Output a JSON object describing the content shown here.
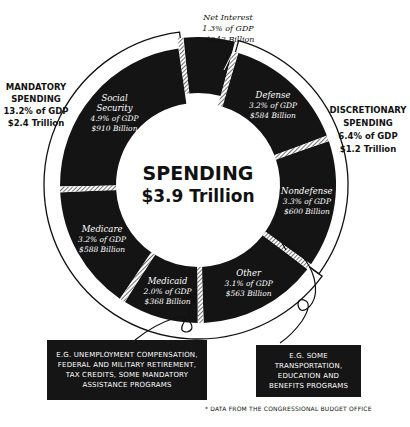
{
  "chart_data": {
    "type": "pie",
    "subtype": "donut",
    "title": "SPENDING",
    "total_label": "$3.9 Trillion",
    "unit": "Billion USD",
    "segments": [
      {
        "name": "Net Interest",
        "pct_gdp": "1.3% of GDP",
        "amount": "$242 Billion",
        "value": 242,
        "group": "net_interest"
      },
      {
        "name": "Defense",
        "pct_gdp": "3.2% of GDP",
        "amount": "$584 Billion",
        "value": 584,
        "group": "discretionary"
      },
      {
        "name": "Nondefense",
        "pct_gdp": "3.3% of GDP",
        "amount": "$600 Billion",
        "value": 600,
        "group": "discretionary"
      },
      {
        "name": "Other",
        "pct_gdp": "3.1% of GDP",
        "amount": "$563 Billion",
        "value": 563,
        "group": "mandatory"
      },
      {
        "name": "Medicaid",
        "pct_gdp": "2.0% of GDP",
        "amount": "$368 Billion",
        "value": 368,
        "group": "mandatory"
      },
      {
        "name": "Medicare",
        "pct_gdp": "3.2% of GDP",
        "amount": "$588 Billion",
        "value": 588,
        "group": "mandatory"
      },
      {
        "name": "Social Security",
        "pct_gdp": "4.9% of GDP",
        "amount": "$910 Billion",
        "value": 910,
        "group": "mandatory"
      }
    ],
    "groups": [
      {
        "id": "mandatory",
        "title_line1": "MANDATORY",
        "title_line2": "SPENDING",
        "pct_gdp": "13.2% of GDP",
        "amount": "$2.4 Trillion",
        "position": "left"
      },
      {
        "id": "discretionary",
        "title_line1": "DISCRETIONARY",
        "title_line2": "SPENDING",
        "pct_gdp": "6.4% of GDP",
        "amount": "$1.2 Trillion",
        "position": "right"
      }
    ],
    "colors": {
      "segment": "#141414",
      "segment_text": "#ffffff",
      "background": "#ffffff",
      "ink": "#111111"
    }
  },
  "notes": {
    "mandatory_other": "E.G. UNEMPLOYMENT COMPENSATION, FEDERAL AND MILITARY RETIREMENT, TAX CREDITS, SOME MANDATORY ASSISTANCE PROGRAMS",
    "nondefense": "E.G. SOME TRANSPORTATION, EDUCATION AND BENEFITS PROGRAMS"
  },
  "footnote": "* DATA FROM THE CONGRESSIONAL BUDGET OFFICE"
}
